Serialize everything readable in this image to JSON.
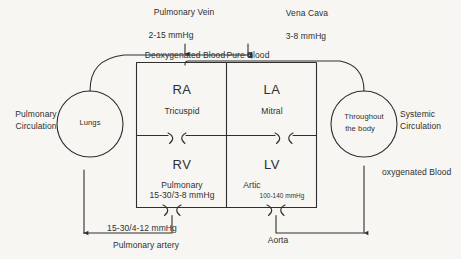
{
  "diagram": {
    "background_color": "#f7f6f2",
    "ink_color": "#2f2f2f",
    "vessels": {
      "pulmonary_vein_label": "Pulmonary Vein",
      "pulmonary_vein_pressure": "2-15 mmHg",
      "vena_cava_label": "Vena Cava",
      "vena_cava_pressure": "3-8 mmHg",
      "pulmonary_artery_label": "Pulmonary artery",
      "pulmonary_artery_pressure": "15-30/4-12 mmHg",
      "aorta_label": "Aorta"
    },
    "blood_labels": {
      "left": "Deoxygenated Blood",
      "right": "Pure Blood",
      "oxygenated": "oxygenated Blood"
    },
    "circles": {
      "lungs": "Lungs",
      "body_line1": "Throughout",
      "body_line2": "the body"
    },
    "circulation": {
      "pulmonary_line1": "Pulmonary",
      "pulmonary_line2": "Circulation",
      "systemic_line1": "Systemic",
      "systemic_line2": "Circulation"
    },
    "chambers": [
      {
        "id": "ra",
        "name": "RA",
        "valve": "Tricuspid",
        "pressure": ""
      },
      {
        "id": "la",
        "name": "LA",
        "valve": "Mitral",
        "pressure": ""
      },
      {
        "id": "rv",
        "name": "RV",
        "valve": "Pulmonary",
        "pressure": "15-30/3-8 mmHg"
      },
      {
        "id": "lv",
        "name": "LV",
        "valve": "Artic",
        "pressure": "100-140 mmHg"
      }
    ]
  }
}
